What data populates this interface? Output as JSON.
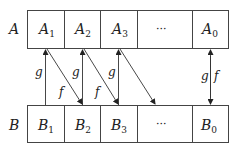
{
  "diagram": {
    "row_labels": {
      "top": "A",
      "bottom": "B"
    },
    "top_row": [
      {
        "main": "A",
        "sub": "1"
      },
      {
        "main": "A",
        "sub": "2"
      },
      {
        "main": "A",
        "sub": "3"
      },
      {
        "main": "···",
        "sub": ""
      },
      {
        "main": "A",
        "sub": "0"
      }
    ],
    "bottom_row": [
      {
        "main": "B",
        "sub": "1"
      },
      {
        "main": "B",
        "sub": "2"
      },
      {
        "main": "B",
        "sub": "3"
      },
      {
        "main": "···",
        "sub": ""
      },
      {
        "main": "B",
        "sub": "0"
      }
    ],
    "arrows": {
      "g_label": "g",
      "f_label": "f"
    },
    "colors": {
      "line": "#333333",
      "background": "#ffffff"
    }
  }
}
